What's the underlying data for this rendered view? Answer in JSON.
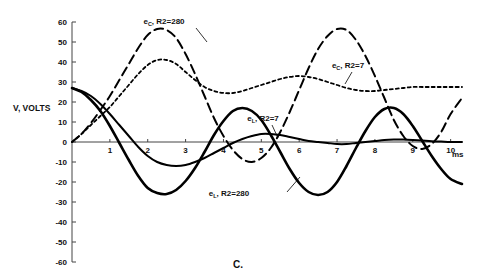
{
  "chart_data": {
    "type": "line",
    "title": "",
    "caption": "C.",
    "xlabel": "ms",
    "ylabel": "V, VOLTS",
    "xlim": [
      0,
      10.3
    ],
    "ylim": [
      -60,
      60
    ],
    "xticks": [
      0,
      1,
      2,
      3,
      4,
      5,
      6,
      7,
      8,
      9,
      10
    ],
    "xtick_labels": [
      "",
      "1",
      "2",
      "3",
      "4",
      "5",
      "6",
      "7",
      "8",
      "9",
      "10"
    ],
    "yticks": [
      -60,
      -50,
      -40,
      -30,
      -20,
      -10,
      0,
      10,
      20,
      30,
      40,
      50,
      60
    ],
    "ytick_labels": [
      "-60",
      "-50",
      "-40",
      "-30",
      "-20",
      "-10",
      "0",
      "10",
      "20",
      "30",
      "40",
      "50",
      "60"
    ],
    "grid": false,
    "legend_position": "inline-annotations",
    "series": [
      {
        "name": "eC-R2-280",
        "label_text": "R2=280",
        "label_prefix": "e",
        "label_sub": "C",
        "style": "long-dash",
        "dash": "9,5",
        "width": 2.0,
        "x": [
          0.0,
          0.25,
          0.5,
          0.75,
          1.0,
          1.25,
          1.5,
          1.75,
          2.0,
          2.25,
          2.5,
          2.75,
          3.0,
          3.25,
          3.5,
          3.75,
          4.0,
          4.25,
          4.5,
          4.75,
          5.0,
          5.25,
          5.5,
          5.75,
          6.0,
          6.25,
          6.5,
          6.75,
          7.0,
          7.25,
          7.5,
          7.75,
          8.0,
          8.25,
          8.5,
          8.75,
          9.0,
          9.25,
          9.5,
          9.75,
          10.0,
          10.3
        ],
        "y": [
          0,
          4,
          9.5,
          16,
          23,
          31,
          39,
          47,
          53.5,
          56.5,
          56,
          52,
          44,
          34,
          23,
          12,
          3,
          -4,
          -8.5,
          -10,
          -8,
          -3,
          5,
          15,
          26,
          37,
          46.5,
          53,
          56.5,
          56,
          51,
          43,
          33,
          22,
          11,
          3,
          -2,
          -3.5,
          -1,
          5,
          14,
          22
        ]
      },
      {
        "name": "eC-R2-7",
        "label_text": "R2=7",
        "label_prefix": "e",
        "label_sub": "C",
        "style": "short-dash",
        "dash": "3,3",
        "width": 1.8,
        "x": [
          0.0,
          0.25,
          0.5,
          0.75,
          1.0,
          1.25,
          1.5,
          1.75,
          2.0,
          2.25,
          2.5,
          2.75,
          3.0,
          3.25,
          3.5,
          3.75,
          4.0,
          4.25,
          4.5,
          4.75,
          5.0,
          5.25,
          5.5,
          5.75,
          6.0,
          6.25,
          6.5,
          6.75,
          7.0,
          7.25,
          7.5,
          7.75,
          8.0,
          8.25,
          8.5,
          8.75,
          9.0,
          9.25,
          9.5,
          9.75,
          10.0,
          10.3
        ],
        "y": [
          0,
          4,
          8.5,
          13,
          17.5,
          23,
          28.5,
          34,
          38.5,
          41,
          41,
          39,
          35,
          31,
          27.5,
          25.5,
          24.5,
          24.5,
          25.5,
          27,
          28.5,
          30,
          31.5,
          32.5,
          33,
          32.5,
          31.5,
          30,
          28.5,
          27,
          26,
          25.5,
          25.5,
          26,
          26.5,
          27,
          27.5,
          27.5,
          27.5,
          27.5,
          27.5,
          27.5
        ]
      },
      {
        "name": "eL-R2-7",
        "label_text": "R2=7",
        "label_prefix": "e",
        "label_sub": "L",
        "style": "solid-thin",
        "dash": "",
        "width": 2.0,
        "x": [
          0.0,
          0.25,
          0.5,
          0.75,
          1.0,
          1.25,
          1.5,
          1.75,
          2.0,
          2.25,
          2.5,
          2.75,
          3.0,
          3.25,
          3.5,
          3.75,
          4.0,
          4.25,
          4.5,
          4.75,
          5.0,
          5.25,
          5.5,
          5.75,
          6.0,
          6.25,
          6.5,
          6.75,
          7.0,
          7.25,
          7.5,
          7.75,
          8.0,
          8.25,
          8.5,
          8.75,
          9.0,
          9.25,
          9.5,
          9.75,
          10.0,
          10.3
        ],
        "y": [
          27,
          25.5,
          23,
          19,
          14,
          8.5,
          3,
          -2.5,
          -7,
          -10,
          -11.5,
          -12,
          -11.5,
          -10,
          -8,
          -5.5,
          -3,
          -0.5,
          1.5,
          3,
          4,
          4,
          3.5,
          2.5,
          1.5,
          0.5,
          0,
          -0.5,
          -1,
          -1,
          -0.5,
          0,
          0.5,
          1,
          1.2,
          1.2,
          1,
          0.7,
          0.4,
          0.2,
          0,
          0
        ]
      },
      {
        "name": "eL-R2-280",
        "label_text": "R2=280",
        "label_prefix": "e",
        "label_sub": "L",
        "style": "solid-thick",
        "dash": "",
        "width": 2.6,
        "x": [
          0.0,
          0.25,
          0.5,
          0.75,
          1.0,
          1.25,
          1.5,
          1.75,
          2.0,
          2.25,
          2.5,
          2.75,
          3.0,
          3.25,
          3.5,
          3.75,
          4.0,
          4.25,
          4.5,
          4.75,
          5.0,
          5.25,
          5.5,
          5.75,
          6.0,
          6.25,
          6.5,
          6.75,
          7.0,
          7.25,
          7.5,
          7.75,
          8.0,
          8.25,
          8.5,
          8.75,
          9.0,
          9.25,
          9.5,
          9.75,
          10.0,
          10.3
        ],
        "y": [
          27,
          25,
          21,
          15.5,
          8,
          -0.5,
          -9,
          -17,
          -23,
          -25.5,
          -26,
          -24,
          -19.5,
          -13,
          -5,
          3.5,
          10.5,
          15.5,
          17,
          15.5,
          11,
          3.5,
          -5,
          -13.5,
          -20.5,
          -25,
          -26.5,
          -25,
          -20,
          -12,
          -3,
          5.5,
          12.5,
          16.5,
          17,
          14,
          8,
          0.5,
          -7,
          -13.5,
          -18.5,
          -21
        ]
      }
    ],
    "annotations": [
      {
        "name": "annotation-ec-r2-280",
        "prefix": "e",
        "sub": "C",
        "text": ", R2=280",
        "x_px": 164,
        "y_px": 24,
        "leader": {
          "x1": 196,
          "y1": 28,
          "x2": 207,
          "y2": 42
        }
      },
      {
        "name": "annotation-ec-r2-7",
        "prefix": "e",
        "sub": "C",
        "text": ", R2=7",
        "x_px": 348,
        "y_px": 68,
        "leader": {
          "x1": 352,
          "y1": 72,
          "x2": 345,
          "y2": 84
        }
      },
      {
        "name": "annotation-el-r2-7",
        "prefix": "e",
        "sub": "L",
        "text": ", R2=7",
        "x_px": 263,
        "y_px": 121,
        "leader": {
          "x1": 272,
          "y1": 125,
          "x2": 278,
          "y2": 138
        }
      },
      {
        "name": "annotation-el-r2-280",
        "prefix": "e",
        "sub": "L",
        "text": ", R2=280",
        "x_px": 229,
        "y_px": 196,
        "leader": {
          "x1": 287,
          "y1": 192,
          "x2": 300,
          "y2": 177
        }
      }
    ]
  }
}
